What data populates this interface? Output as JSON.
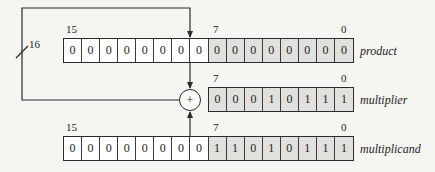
{
  "diagram": {
    "bus_width_label": "16",
    "adder_symbol": "+",
    "registers": {
      "product": {
        "label": "product",
        "high_bit_label": "15",
        "mid_bit_label": "7",
        "low_bit_label": "0",
        "bits": [
          "0",
          "0",
          "0",
          "0",
          "0",
          "0",
          "0",
          "0",
          "0",
          "0",
          "0",
          "0",
          "0",
          "0",
          "0",
          "0"
        ]
      },
      "multiplier": {
        "label": "multiplier",
        "high_bit_label": "7",
        "low_bit_label": "0",
        "bits": [
          "0",
          "0",
          "0",
          "1",
          "0",
          "1",
          "1",
          "1"
        ]
      },
      "multiplicand": {
        "label": "multiplicand",
        "high_bit_label": "15",
        "mid_bit_label": "7",
        "low_bit_label": "0",
        "bits": [
          "0",
          "0",
          "0",
          "0",
          "0",
          "0",
          "0",
          "0",
          "1",
          "1",
          "0",
          "1",
          "0",
          "1",
          "1",
          "1"
        ]
      }
    },
    "colors": {
      "upper_half_cell": "#ffffff",
      "lower_half_cell": "#e1e0dd",
      "line": "#2a2a2a"
    }
  }
}
